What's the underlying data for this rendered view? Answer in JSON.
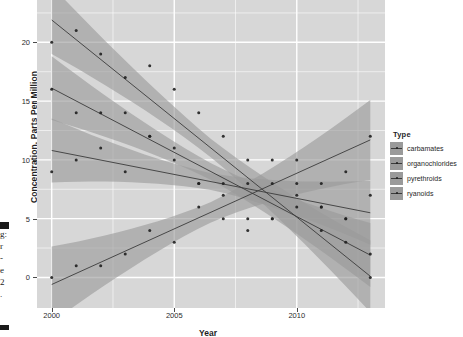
{
  "chart_data": {
    "type": "scatter",
    "title": "",
    "xlabel": "Year",
    "ylabel": "Concentration, Parts Per Million",
    "xlim": [
      1999.4,
      2013.6
    ],
    "ylim": [
      -2.6,
      23.6
    ],
    "xticks": [
      "2000",
      "2005",
      "2010"
    ],
    "xtick_values": [
      2000,
      2005,
      2010
    ],
    "yticks": [
      "0",
      "5",
      "10",
      "15",
      "20"
    ],
    "ytick_values": [
      0,
      5,
      10,
      15,
      20
    ],
    "grid": true,
    "legend_title": "Type",
    "legend_position": "right",
    "panel_background": "#d7d7d7",
    "grid_color": "#ffffff",
    "band_color": "#9a9a9a",
    "line_color": "#3b3b3b",
    "point_color": "#1f1f1f",
    "x": [
      2000,
      2001,
      2002,
      2003,
      2004,
      2005,
      2006,
      2007,
      2008,
      2009,
      2010,
      2011,
      2012,
      2013
    ],
    "series": [
      {
        "name": "carbamates",
        "values": [
          0,
          1,
          1,
          2,
          4,
          3,
          6,
          5,
          4,
          5,
          8,
          6,
          9,
          12
        ],
        "fit_start": -0.6,
        "fit_end": 11.7,
        "band_start": 1.9,
        "band_end": 2.0
      },
      {
        "name": "organochlorides",
        "values": [
          20,
          21,
          19,
          17,
          18,
          16,
          14,
          12,
          10,
          10,
          10,
          8,
          5,
          0
        ],
        "fit_start": 21.9,
        "fit_end": 0.1,
        "band_start": 1.7,
        "band_end": 1.8
      },
      {
        "name": "pyrethroids",
        "values": [
          9,
          10,
          11,
          9,
          12,
          11,
          8,
          8,
          8,
          8,
          7,
          6,
          5,
          7
        ],
        "fit_start": 10.8,
        "fit_end": 5.5,
        "band_start": 1.6,
        "band_end": 1.6
      },
      {
        "name": "ryanoids",
        "values": [
          16,
          14,
          14,
          14,
          12,
          10,
          8,
          7,
          5,
          5,
          6,
          4,
          3,
          2
        ],
        "fit_start": 16.1,
        "fit_end": 1.9,
        "band_start": 1.6,
        "band_end": 1.6
      }
    ]
  },
  "legend": {
    "title": "Type",
    "items": [
      {
        "label": "carbamates"
      },
      {
        "label": "organochlorides"
      },
      {
        "label": "pyrethroids"
      },
      {
        "label": "ryanoids"
      }
    ]
  },
  "axes": {
    "y_title": "Concentration, Parts Per Million",
    "x_title": "Year",
    "x_tick_labels": [
      "2000",
      "2005",
      "2010"
    ],
    "y_tick_labels": [
      "0",
      "5",
      "10",
      "15",
      "20"
    ]
  },
  "clipped_text": {
    "lines": [
      "g:",
      "r",
      "-",
      "e",
      "2",
      "."
    ]
  }
}
